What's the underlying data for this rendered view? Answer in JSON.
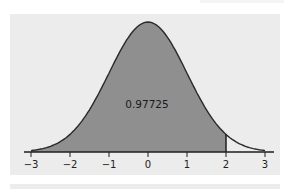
{
  "chart_data": {
    "type": "area",
    "title": "",
    "xlabel": "",
    "ylabel": "",
    "distribution": "standard normal",
    "x_ticks": [
      -3,
      -2,
      -1,
      0,
      1,
      2,
      3
    ],
    "tick_labels": [
      "−3",
      "−2",
      "−1",
      "0",
      "1",
      "2",
      "3"
    ],
    "xlim": [
      -3,
      3
    ],
    "shaded_region": {
      "from": -3,
      "to": 2
    },
    "boundary_marker": 2,
    "annotation": "0.97725",
    "grid": false,
    "legend": null
  },
  "colors": {
    "panel_background": "#ececec",
    "shaded_fill": "#8f8f8f",
    "curve_stroke": "#2a2a2a",
    "axis": "#1e1e1e"
  }
}
